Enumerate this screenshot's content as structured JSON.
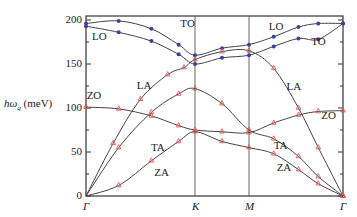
{
  "chart_data": {
    "type": "line",
    "title": "",
    "xlabel": "",
    "ylabel": "ħω_q (meV)",
    "ylabel_parts": {
      "main": "hω",
      "sub": "q",
      "unit": " (meV)"
    },
    "ylim": [
      0,
      200
    ],
    "yticks": [
      0,
      50,
      100,
      150,
      200
    ],
    "x_ticks": [
      "Γ",
      "K",
      "M",
      "Γ"
    ],
    "x_positions": [
      0,
      1,
      1.5,
      2.45
    ],
    "grid": false,
    "vertical_lines_at": [
      "K",
      "M"
    ],
    "branch_labels": [
      {
        "text": "TO",
        "x": 0.93,
        "y": 196
      },
      {
        "text": "LO",
        "x": 0.12,
        "y": 181
      },
      {
        "text": "ZO",
        "x": 0.07,
        "y": 114
      },
      {
        "text": "LA",
        "x": 0.53,
        "y": 125
      },
      {
        "text": "TA",
        "x": 0.66,
        "y": 55
      },
      {
        "text": "ZA",
        "x": 0.69,
        "y": 26
      },
      {
        "text": "LO",
        "x": 1.77,
        "y": 192
      },
      {
        "text": "TO",
        "x": 2.2,
        "y": 175
      },
      {
        "text": "LA",
        "x": 1.95,
        "y": 124
      },
      {
        "text": "ZO",
        "x": 2.3,
        "y": 91
      },
      {
        "text": "TA",
        "x": 1.82,
        "y": 57
      },
      {
        "text": "ZA",
        "x": 1.85,
        "y": 32
      }
    ],
    "series": [
      {
        "name": "TO",
        "x": [
          0,
          0.3,
          0.6,
          0.85,
          1.0,
          1.25,
          1.5,
          1.75,
          2.0,
          2.2,
          2.45
        ],
        "values": [
          196,
          199,
          190,
          172,
          160,
          168,
          172,
          181,
          192,
          196,
          196
        ]
      },
      {
        "name": "LO",
        "x": [
          0,
          0.3,
          0.6,
          0.85,
          1.0,
          1.25,
          1.5,
          1.75,
          2.0,
          2.2,
          2.45
        ],
        "values": [
          193,
          186,
          176,
          161,
          150,
          157,
          160,
          170,
          179,
          178,
          196
        ]
      },
      {
        "name": "LA",
        "x": [
          0,
          0.25,
          0.5,
          0.75,
          0.9,
          1.0,
          1.25,
          1.5,
          1.75,
          2.0,
          2.2,
          2.45
        ],
        "values": [
          0,
          60,
          110,
          138,
          146,
          155,
          164,
          165,
          145,
          100,
          55,
          0
        ]
      },
      {
        "name": "ZO",
        "x": [
          0,
          0.3,
          0.6,
          0.85,
          1.0,
          1.25,
          1.5,
          1.75,
          2.0,
          2.2,
          2.45
        ],
        "values": [
          101,
          99,
          91,
          80,
          75,
          73,
          72,
          83,
          92,
          96,
          97
        ]
      },
      {
        "name": "TA",
        "x": [
          0,
          0.3,
          0.6,
          0.85,
          1.0,
          1.25,
          1.5,
          1.75,
          2.0,
          2.2,
          2.45
        ],
        "values": [
          0,
          55,
          95,
          116,
          122,
          105,
          75,
          65,
          45,
          22,
          0
        ]
      },
      {
        "name": "ZA",
        "x": [
          0,
          0.3,
          0.6,
          0.85,
          1.0,
          1.25,
          1.5,
          1.75,
          2.0,
          2.2,
          2.45
        ],
        "values": [
          0,
          12,
          40,
          62,
          73,
          62,
          55,
          48,
          30,
          14,
          0
        ]
      }
    ],
    "markers": {
      "experimental_blue": {
        "color": "#3a3fa0",
        "shape": "circle",
        "description": "optical branch data points"
      },
      "experimental_red": {
        "color": "#e0574e",
        "shape": "triangle",
        "description": "acoustic/ZO branch data points"
      }
    },
    "line_color": "#444444"
  }
}
